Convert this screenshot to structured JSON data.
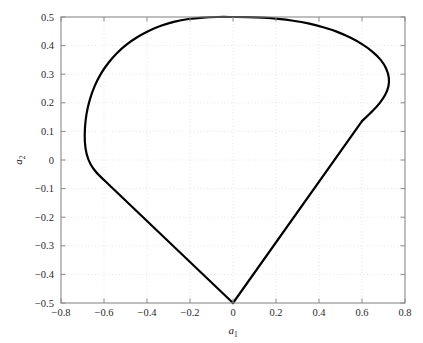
{
  "chart_data": {
    "type": "line",
    "title": "",
    "subtitle": "",
    "xlabel": "a1",
    "xlabel_base": "a",
    "xlabel_sub": "1",
    "ylabel": "a2",
    "ylabel_base": "a",
    "ylabel_sub": "2",
    "xlim": [
      -0.8,
      0.8
    ],
    "ylim": [
      -0.5,
      0.5
    ],
    "xticks": [
      -0.8,
      -0.6,
      -0.4,
      -0.2,
      0,
      0.2,
      0.4,
      0.6,
      0.8
    ],
    "xtick_labels": [
      "-0.8",
      "-0.6",
      "-0.4",
      "-0.2",
      "0",
      "0.2",
      "0.4",
      "0.6",
      "0.8"
    ],
    "yticks": [
      -0.5,
      -0.4,
      -0.3,
      -0.2,
      -0.1,
      0,
      0.1,
      0.2,
      0.3,
      0.4,
      0.5
    ],
    "ytick_labels": [
      "-0.5",
      "-0.4",
      "-0.3",
      "-0.2",
      "-0.1",
      "0",
      "0.1",
      "0.2",
      "0.3",
      "0.4",
      "0.5"
    ],
    "grid": true,
    "grid_style": "dotted",
    "grid_color": "#d9d9d9",
    "legend": null,
    "legend_position": "none",
    "box": true,
    "line_color": "#000000",
    "line_width": 2.2,
    "background_color": "#ffffff",
    "axis_color": "#8a8a8a",
    "series": [
      {
        "name": "closed-region-boundary",
        "closed": true,
        "annotations": [
          {
            "label": "apex",
            "x": 0.04,
            "y": 0.5
          },
          {
            "label": "left-extreme",
            "x": -0.685,
            "y": 0.3
          },
          {
            "label": "right-extreme",
            "x": 0.72,
            "y": 0.285
          },
          {
            "label": "bottom-vertex",
            "x": 0.0,
            "y": -0.5
          }
        ],
        "points": [
          [
            0.0,
            -0.5
          ],
          [
            -0.06,
            -0.457
          ],
          [
            -0.12,
            -0.414
          ],
          [
            -0.18,
            -0.371
          ],
          [
            -0.24,
            -0.328
          ],
          [
            -0.3,
            -0.285
          ],
          [
            -0.36,
            -0.242
          ],
          [
            -0.42,
            -0.199
          ],
          [
            -0.48,
            -0.156
          ],
          [
            -0.54,
            -0.113
          ],
          [
            -0.6,
            -0.07
          ],
          [
            -0.635,
            -0.044
          ],
          [
            -0.663,
            -0.014
          ],
          [
            -0.681,
            0.022
          ],
          [
            -0.689,
            0.064
          ],
          [
            -0.6885,
            0.112
          ],
          [
            -0.681,
            0.162
          ],
          [
            -0.6655,
            0.212
          ],
          [
            -0.643,
            0.259
          ],
          [
            -0.614,
            0.302
          ],
          [
            -0.579,
            0.34
          ],
          [
            -0.539,
            0.374
          ],
          [
            -0.494,
            0.404
          ],
          [
            -0.444,
            0.43
          ],
          [
            -0.39,
            0.452
          ],
          [
            -0.332,
            0.47
          ],
          [
            -0.271,
            0.484
          ],
          [
            -0.207,
            0.493
          ],
          [
            -0.14,
            0.498
          ],
          [
            -0.07,
            0.5
          ],
          [
            0.0,
            0.5
          ],
          [
            0.07,
            0.4995
          ],
          [
            0.14,
            0.4975
          ],
          [
            0.21,
            0.4935
          ],
          [
            0.28,
            0.487
          ],
          [
            0.35,
            0.4775
          ],
          [
            0.42,
            0.464
          ],
          [
            0.485,
            0.448
          ],
          [
            0.545,
            0.428
          ],
          [
            0.6,
            0.405
          ],
          [
            0.648,
            0.379
          ],
          [
            0.687,
            0.35
          ],
          [
            0.712,
            0.32
          ],
          [
            0.7245,
            0.289
          ],
          [
            0.723,
            0.258
          ],
          [
            0.708,
            0.228
          ],
          [
            0.683,
            0.2
          ],
          [
            0.65,
            0.172
          ],
          [
            0.6,
            0.136
          ],
          [
            0.54,
            0.093
          ],
          [
            0.48,
            0.05
          ],
          [
            0.42,
            0.007
          ],
          [
            0.36,
            -0.036
          ],
          [
            0.3,
            -0.079
          ],
          [
            0.24,
            -0.122
          ],
          [
            0.18,
            -0.165
          ],
          [
            0.12,
            -0.208
          ],
          [
            0.06,
            -0.251
          ],
          [
            0.0,
            -0.294
          ],
          [
            -0.0,
            -0.294
          ]
        ]
      }
    ]
  },
  "figure": {
    "plot_box": {
      "left_px": 61,
      "right_px": 405,
      "top_px": 17,
      "bottom_px": 303
    }
  }
}
